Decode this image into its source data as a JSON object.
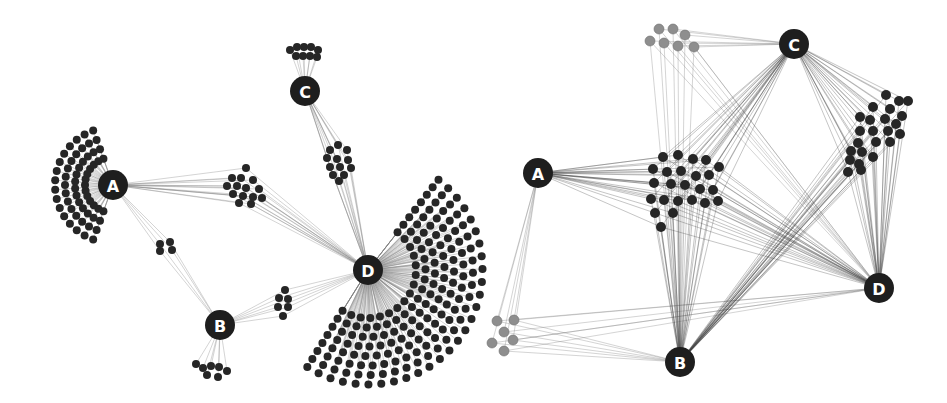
{
  "colors": {
    "background": "#ffffff",
    "hub": "#1e1e1e",
    "leaf": "#262626",
    "leaf_gray": "#8e8e8e",
    "edge": "#7a7a7a",
    "edge_dark": "#3c3c3c",
    "hub_text": "#ffffff"
  },
  "graphs": [
    {
      "name": "left-network",
      "hub_radius": 15,
      "leaf_radius": 4,
      "hubs": [
        {
          "id": "A",
          "label": "A",
          "x": 113,
          "y": 185
        },
        {
          "id": "B",
          "label": "B",
          "x": 220,
          "y": 325
        },
        {
          "id": "C",
          "label": "C",
          "x": 305,
          "y": 91
        },
        {
          "id": "D",
          "label": "D",
          "x": 368,
          "y": 270
        }
      ],
      "clusters": [
        {
          "name": "A-only",
          "hubs": [
            "A"
          ],
          "shape": "arc",
          "cx": 113,
          "cy": 185,
          "r0": 28,
          "rings": 4,
          "ring_gap": 10,
          "a0": 110,
          "a1": 250,
          "counts": [
            13,
            14,
            15,
            16
          ],
          "color": "leaf"
        },
        {
          "name": "C-only",
          "hubs": [
            "C"
          ],
          "shape": "grid",
          "points": [
            [
              290,
              50
            ],
            [
              297,
              47
            ],
            [
              304,
              47
            ],
            [
              311,
              47
            ],
            [
              318,
              50
            ],
            [
              296,
              56
            ],
            [
              303,
              56
            ],
            [
              310,
              56
            ],
            [
              317,
              57
            ]
          ],
          "color": "leaf"
        },
        {
          "name": "A-D",
          "hubs": [
            "A",
            "D"
          ],
          "shape": "grid",
          "points": [
            [
              246,
              168
            ],
            [
              232,
              178
            ],
            [
              241,
              178
            ],
            [
              253,
              180
            ],
            [
              227,
              186
            ],
            [
              237,
              186
            ],
            [
              246,
              188
            ],
            [
              259,
              189
            ],
            [
              233,
              194
            ],
            [
              243,
              196
            ],
            [
              253,
              197
            ],
            [
              239,
              203
            ],
            [
              251,
              204
            ],
            [
              262,
              198
            ]
          ],
          "color": "leaf"
        },
        {
          "name": "C-D",
          "hubs": [
            "C",
            "D"
          ],
          "shape": "grid",
          "points": [
            [
              338,
              145
            ],
            [
              330,
              150
            ],
            [
              347,
              150
            ],
            [
              327,
              158
            ],
            [
              337,
              159
            ],
            [
              348,
              160
            ],
            [
              330,
              167
            ],
            [
              340,
              167
            ],
            [
              351,
              168
            ],
            [
              333,
              175
            ],
            [
              344,
              175
            ],
            [
              339,
              181
            ]
          ],
          "color": "leaf"
        },
        {
          "name": "A-B",
          "hubs": [
            "A",
            "B"
          ],
          "shape": "grid",
          "points": [
            [
              160,
              244
            ],
            [
              170,
              242
            ],
            [
              160,
              251
            ],
            [
              172,
              250
            ]
          ],
          "color": "leaf"
        },
        {
          "name": "B-D",
          "hubs": [
            "B",
            "D"
          ],
          "shape": "grid",
          "points": [
            [
              285,
              290
            ],
            [
              279,
              298
            ],
            [
              288,
              299
            ],
            [
              278,
              307
            ],
            [
              288,
              307
            ],
            [
              283,
              316
            ]
          ],
          "color": "leaf"
        },
        {
          "name": "B-only",
          "hubs": [
            "B"
          ],
          "shape": "grid",
          "points": [
            [
              196,
              364
            ],
            [
              203,
              368
            ],
            [
              211,
              366
            ],
            [
              207,
              375
            ],
            [
              219,
              367
            ],
            [
              227,
              371
            ],
            [
              218,
              377
            ]
          ],
          "color": "leaf"
        },
        {
          "name": "D-only",
          "hubs": [
            "D"
          ],
          "shape": "arc",
          "cx": 368,
          "cy": 270,
          "r0": 48,
          "rings": 8,
          "ring_gap": 9.5,
          "a0": -52,
          "a1": 122,
          "counts": [
            16,
            18,
            20,
            22,
            24,
            26,
            27,
            28
          ],
          "color": "leaf"
        }
      ]
    },
    {
      "name": "right-network",
      "hub_radius": 15,
      "leaf_radius": 5,
      "hubs": [
        {
          "id": "A",
          "label": "A",
          "x": 538,
          "y": 173
        },
        {
          "id": "B",
          "label": "B",
          "x": 680,
          "y": 362
        },
        {
          "id": "C",
          "label": "C",
          "x": 794,
          "y": 44
        },
        {
          "id": "D",
          "label": "D",
          "x": 879,
          "y": 288
        }
      ],
      "clusters": [
        {
          "name": "gray-C-top",
          "hubs": [
            "C",
            "B",
            "D"
          ],
          "shape": "grid",
          "points": [
            [
              659,
              29
            ],
            [
              673,
              29
            ],
            [
              685,
              35
            ],
            [
              650,
              41
            ],
            [
              664,
              43
            ],
            [
              678,
              46
            ],
            [
              694,
              47
            ]
          ],
          "color": "leaf_gray",
          "edge_color": "edge"
        },
        {
          "name": "gray-A-B",
          "hubs": [
            "A",
            "B",
            "D"
          ],
          "shape": "grid",
          "points": [
            [
              497,
              321
            ],
            [
              514,
              320
            ],
            [
              504,
              332
            ],
            [
              513,
              340
            ],
            [
              492,
              343
            ],
            [
              504,
              351
            ]
          ],
          "color": "leaf_gray",
          "edge_color": "edge"
        },
        {
          "name": "center-ACDB",
          "hubs": [
            "A",
            "B",
            "C",
            "D"
          ],
          "shape": "grid",
          "points": [
            [
              663,
              157
            ],
            [
              678,
              155
            ],
            [
              693,
              159
            ],
            [
              706,
              160
            ],
            [
              653,
              169
            ],
            [
              667,
              172
            ],
            [
              681,
              171
            ],
            [
              696,
              176
            ],
            [
              709,
              175
            ],
            [
              719,
              167
            ],
            [
              654,
              183
            ],
            [
              671,
              184
            ],
            [
              685,
              185
            ],
            [
              700,
              189
            ],
            [
              713,
              190
            ],
            [
              651,
              199
            ],
            [
              664,
              200
            ],
            [
              678,
              201
            ],
            [
              692,
              200
            ],
            [
              705,
              203
            ],
            [
              718,
              201
            ],
            [
              655,
              213
            ],
            [
              673,
              213
            ],
            [
              661,
              227
            ]
          ],
          "edge_color": "edge_dark",
          "color": "leaf"
        },
        {
          "name": "right-CDB",
          "hubs": [
            "B",
            "C",
            "D"
          ],
          "shape": "grid",
          "points": [
            [
              886,
              95
            ],
            [
              899,
              101
            ],
            [
              908,
              101
            ],
            [
              873,
              107
            ],
            [
              890,
              109
            ],
            [
              902,
              116
            ],
            [
              860,
              117
            ],
            [
              870,
              120
            ],
            [
              885,
              119
            ],
            [
              896,
              124
            ],
            [
              860,
              131
            ],
            [
              873,
              131
            ],
            [
              888,
              131
            ],
            [
              900,
              134
            ],
            [
              858,
              143
            ],
            [
              876,
              142
            ],
            [
              890,
              142
            ],
            [
              851,
              151
            ],
            [
              862,
              152
            ],
            [
              873,
              157
            ],
            [
              850,
              160
            ],
            [
              859,
              164
            ],
            [
              848,
              172
            ],
            [
              861,
              170
            ]
          ],
          "edge_color": "edge_dark",
          "color": "leaf"
        }
      ]
    }
  ]
}
